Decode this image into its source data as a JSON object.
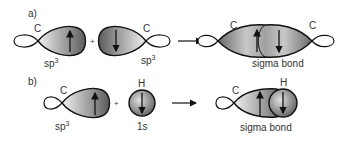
{
  "figure": {
    "panels": [
      {
        "label": "a)",
        "reactant1": {
          "atom": "C",
          "orbital": "sp",
          "superscript": "3",
          "spin": "up"
        },
        "plus": "+",
        "reactant2": {
          "atom": "C",
          "orbital": "sp",
          "superscript": "3",
          "spin": "down"
        },
        "arrow": "reaction-arrow",
        "product": {
          "atom_left": "C",
          "atom_right": "C",
          "caption": "sigma bond"
        }
      },
      {
        "label": "b)",
        "reactant1": {
          "atom": "C",
          "orbital": "sp",
          "superscript": "3",
          "spin": "up"
        },
        "plus": "+",
        "reactant2": {
          "atom": "H",
          "orbital": "1s",
          "spin": "down"
        },
        "arrow": "reaction-arrow",
        "product": {
          "atom_left": "C",
          "atom_right": "H",
          "caption": "sigma bond"
        }
      }
    ]
  },
  "colors": {
    "lobe_dark": "#555555",
    "lobe_light": "#e6e6e6",
    "outline": "#111111",
    "text": "#333333"
  }
}
